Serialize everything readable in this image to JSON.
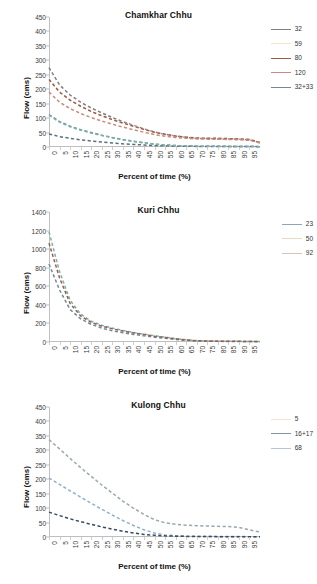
{
  "figure": {
    "axis_label_x": "Percent of time (%)",
    "axis_label_y": "Flow (cms)"
  },
  "charts": [
    {
      "title": "Chamkhar Chhu",
      "yticks": [
        "0",
        "50",
        "100",
        "150",
        "200",
        "250",
        "300",
        "350",
        "400",
        "450"
      ],
      "xticks": [
        "0",
        "5",
        "10",
        "15",
        "20",
        "25",
        "30",
        "35",
        "40",
        "45",
        "50",
        "55",
        "60",
        "65",
        "70",
        "75",
        "80",
        "85",
        "90",
        "95"
      ],
      "legend": [
        {
          "label": "32",
          "color": "#7f7f7f"
        },
        {
          "label": "59",
          "color": "#f2e6c9"
        },
        {
          "label": "80",
          "color": "#9e5b4a"
        },
        {
          "label": "120",
          "color": "#c98b7e"
        },
        {
          "label": "32+33",
          "color": "#6d8a9c"
        }
      ],
      "chart_data": {
        "type": "line",
        "title": "Chamkhar Chhu",
        "xlabel": "Percent of time (%)",
        "ylabel": "Flow (cms)",
        "xlim": [
          0,
          100
        ],
        "ylim": [
          0,
          450
        ],
        "grid": false,
        "legend_position": "right",
        "x": [
          0,
          5,
          10,
          15,
          20,
          25,
          30,
          35,
          40,
          45,
          50,
          55,
          60,
          65,
          70,
          75,
          80,
          85,
          90,
          95,
          100
        ],
        "series": [
          {
            "name": "32",
            "color": "#7f7f7f",
            "values": [
              275,
              215,
              180,
              155,
              135,
              118,
              102,
              88,
              75,
              63,
              52,
              44,
              38,
              33,
              30,
              29,
              28,
              28,
              27,
              25,
              15
            ]
          },
          {
            "name": "59",
            "color": "#f2e6c9",
            "values": [
              236,
              192,
              163,
              142,
              124,
              109,
              96,
              84,
              73,
              62,
              52,
              44,
              38,
              34,
              31,
              30,
              30,
              29,
              28,
              26,
              16
            ]
          },
          {
            "name": "80",
            "color": "#9e5b4a",
            "values": [
              234,
              190,
              162,
              141,
              123,
              108,
              95,
              83,
              72,
              61,
              51,
              44,
              38,
              34,
              31,
              30,
              30,
              29,
              28,
              26,
              16
            ]
          },
          {
            "name": "120",
            "color": "#c98b7e",
            "values": [
              190,
              155,
              133,
              116,
              102,
              90,
              79,
              69,
              60,
              51,
              43,
              37,
              33,
              30,
              28,
              27,
              27,
              26,
              25,
              23,
              14
            ]
          },
          {
            "name": "32+33",
            "color": "#6d8a9c",
            "values": [
              112,
              88,
              72,
              60,
              50,
              41,
              33,
              26,
              20,
              15,
              10,
              7,
              5,
              4,
              3,
              3,
              3,
              2,
              2,
              2,
              1
            ]
          },
          {
            "name": "lowest",
            "color": "#5b6e7a",
            "values": [
              45,
              36,
              30,
              25,
              21,
              17,
              14,
              11,
              9,
              7,
              5,
              4,
              3,
              3,
              2,
              2,
              2,
              2,
              2,
              2,
              1
            ]
          },
          {
            "name": "teal",
            "color": "#79b3ab",
            "values": [
              110,
              86,
              70,
              58,
              48,
              40,
              32,
              25,
              19,
              14,
              10,
              7,
              5,
              4,
              3,
              3,
              2,
              2,
              2,
              2,
              1
            ]
          }
        ]
      }
    },
    {
      "title": "Kuri Chhu",
      "yticks": [
        "0",
        "200",
        "400",
        "600",
        "800",
        "1000",
        "1200",
        "1400"
      ],
      "xticks": [
        "0",
        "5",
        "10",
        "15",
        "20",
        "25",
        "30",
        "35",
        "40",
        "45",
        "50",
        "55",
        "60",
        "65",
        "70",
        "75",
        "80",
        "85",
        "90",
        "95"
      ],
      "legend": [
        {
          "label": "23",
          "color": "#8fa6b5"
        },
        {
          "label": "50",
          "color": "#e8dcc0"
        },
        {
          "label": "92",
          "color": "#d9c3bc"
        }
      ],
      "chart_data": {
        "type": "line",
        "title": "Kuri Chhu",
        "xlabel": "Percent of time (%)",
        "ylabel": "Flow (cms)",
        "xlim": [
          0,
          100
        ],
        "ylim": [
          0,
          1400
        ],
        "grid": false,
        "legend_position": "right",
        "x": [
          0,
          5,
          10,
          15,
          20,
          25,
          30,
          35,
          40,
          45,
          50,
          55,
          60,
          65,
          70,
          75,
          80,
          85,
          90,
          95,
          100
        ],
        "series": [
          {
            "name": "23",
            "color": "#6d8a9c",
            "values": [
              840,
              560,
              350,
              250,
              190,
              150,
              120,
              100,
              82,
              66,
              52,
              40,
              28,
              18,
              12,
              9,
              7,
              6,
              6,
              5,
              3
            ]
          },
          {
            "name": "50",
            "color": "#79b3ab",
            "values": [
              1185,
              760,
              450,
              300,
              225,
              180,
              150,
              125,
              103,
              84,
              67,
              52,
              36,
              23,
              15,
              11,
              9,
              8,
              7,
              6,
              4
            ]
          },
          {
            "name": "92",
            "color": "#9e5b4a",
            "values": [
              1065,
              690,
              415,
              280,
              212,
              170,
              142,
              118,
              98,
              80,
              63,
              49,
              34,
              22,
              14,
              10,
              8,
              7,
              7,
              6,
              4
            ]
          }
        ]
      }
    },
    {
      "title": "Kulong Chhu",
      "yticks": [
        "0",
        "50",
        "100",
        "150",
        "200",
        "250",
        "300",
        "350",
        "400",
        "450"
      ],
      "xticks": [
        "0",
        "5",
        "10",
        "15",
        "20",
        "25",
        "30",
        "35",
        "40",
        "45",
        "50",
        "55",
        "60",
        "65",
        "70",
        "75",
        "80",
        "85",
        "90",
        "95"
      ],
      "legend": [
        {
          "label": "5",
          "color": "#efe6cf"
        },
        {
          "label": "16+17",
          "color": "#7f93a6"
        },
        {
          "label": "68",
          "color": "#b9c6cf"
        }
      ],
      "chart_data": {
        "type": "line",
        "title": "Kulong Chhu",
        "xlabel": "Percent of time (%)",
        "ylabel": "Flow (cms)",
        "xlim": [
          0,
          100
        ],
        "ylim": [
          0,
          450
        ],
        "grid": false,
        "legend_position": "right",
        "x": [
          0,
          5,
          10,
          15,
          20,
          25,
          30,
          35,
          40,
          45,
          50,
          55,
          60,
          65,
          70,
          75,
          80,
          85,
          90,
          95,
          100
        ],
        "series": [
          {
            "name": "5",
            "color": "#9aa7b0",
            "values": [
              337,
              305,
              272,
              240,
              210,
              180,
              152,
              124,
              100,
              78,
              60,
              49,
              44,
              41,
              39,
              38,
              37,
              36,
              33,
              25,
              17
            ]
          },
          {
            "name": "16+17",
            "color": "#8fb0cc",
            "values": [
              204,
              182,
              160,
              138,
              117,
              96,
              76,
              57,
              40,
              25,
              14,
              7,
              4,
              3,
              2,
              2,
              2,
              2,
              2,
              1,
              1
            ]
          },
          {
            "name": "68",
            "color": "#3a4a63",
            "values": [
              86,
              74,
              63,
              53,
              44,
              35,
              27,
              20,
              14,
              9,
              6,
              4,
              3,
              2,
              2,
              2,
              1,
              1,
              1,
              1,
              1
            ]
          }
        ]
      }
    }
  ]
}
